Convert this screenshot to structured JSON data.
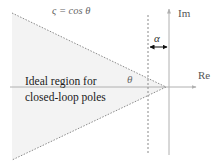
{
  "diagram": {
    "axes": {
      "real_label": "Re",
      "imag_label": "Im"
    },
    "labels": {
      "damping_eq": "ς = cos θ",
      "angle": "θ",
      "offset": "α",
      "region_line1": "Ideal region for",
      "region_line2": "closed-loop poles"
    },
    "colors": {
      "region_fill": "#f3f3f3",
      "axis": "#b0b0b0",
      "dashed": "#8a8a8a",
      "arrow": "#111111",
      "text": "#222222",
      "axis_text": "#555555"
    }
  }
}
